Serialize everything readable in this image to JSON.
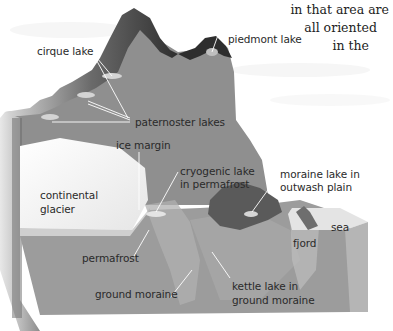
{
  "caption_text": {
    "line1": "in that area are",
    "line2": "all oriented",
    "line3": "in the"
  },
  "diagram": {
    "type": "glacial landforms block diagram",
    "labels": {
      "cirque_lake": "cirque lake",
      "piedmont_lake": "piedmont lake",
      "paternoster_lakes": "paternoster lakes",
      "ice_margin": "ice margin",
      "cryogenic_lake_l1": "cryogenic lake",
      "cryogenic_lake_l2": "in permafrost",
      "moraine_lake_l1": "moraine lake in",
      "moraine_lake_l2": "outwash plain",
      "continental_glacier_l1": "continental",
      "continental_glacier_l2": "glacier",
      "sea": "sea",
      "fjord": "fjord",
      "permafrost": "permafrost",
      "kettle_lake_l1": "kettle lake in",
      "kettle_lake_l2": "ground moraine",
      "ground_moraine": "ground moraine"
    },
    "colors": {
      "block_front": "#9a9a9a",
      "block_side": "#c8c8c8",
      "mountain_face": "#8e8e8e",
      "ridge_dark": "#3a3a3a",
      "glacier_ice": "#f4f4f4",
      "moraine_lake_basin": "#5a5a5a",
      "sea_surface": "#e2e2e2",
      "leader_line": "#ffffff"
    }
  }
}
